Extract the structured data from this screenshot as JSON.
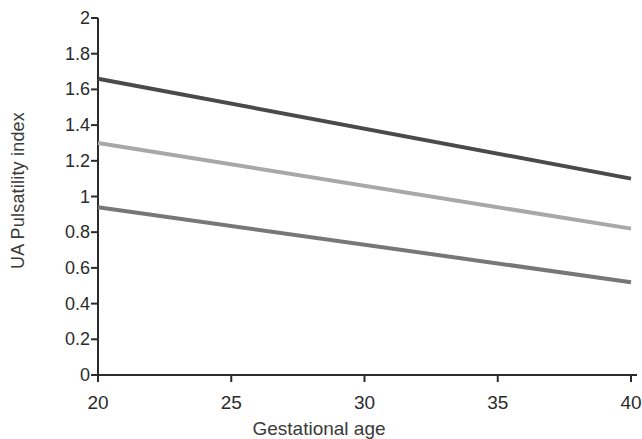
{
  "chart_data": {
    "type": "line",
    "title": "",
    "xlabel": "Gestational age",
    "ylabel": "UA Pulsatility index",
    "xlim": [
      20,
      40
    ],
    "ylim": [
      0,
      2
    ],
    "x": [
      20,
      40
    ],
    "xticks": [
      20,
      25,
      30,
      35,
      40
    ],
    "xtick_labels": [
      "20",
      "25",
      "30",
      "35",
      "40"
    ],
    "yticks": [
      0,
      0.2,
      0.4,
      0.6,
      0.8,
      1,
      1.2,
      1.4,
      1.6,
      1.8,
      2
    ],
    "ytick_labels": [
      "0",
      "0.2",
      "0.4",
      "0.6",
      "0.8",
      "1",
      "1.2",
      "1.4",
      "1.6",
      "1.8",
      "2"
    ],
    "grid": false,
    "legend": "none",
    "series": [
      {
        "name": "upper-centile",
        "values": [
          1.66,
          1.1
        ],
        "color": "#4a4a4a",
        "width": 4
      },
      {
        "name": "median-centile",
        "values": [
          1.3,
          0.82
        ],
        "color": "#a8a8a8",
        "width": 4
      },
      {
        "name": "lower-centile",
        "values": [
          0.94,
          0.52
        ],
        "color": "#777777",
        "width": 4
      }
    ]
  },
  "axes": {
    "axis_color": "#2b2b2b",
    "axis_width": 2,
    "tick_length": 7
  }
}
